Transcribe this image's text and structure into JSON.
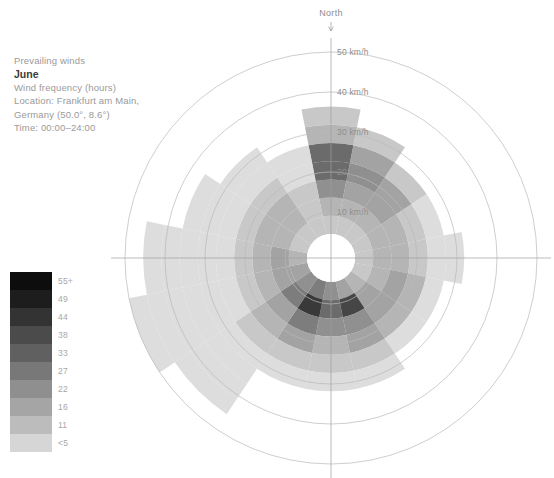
{
  "caption": {
    "title": "Prevailing winds",
    "month": "June",
    "metric": "Wind frequency (hours)",
    "location_line1": "Location: Frankfurt am Main,",
    "location_line2": "Germany (50.0°, 8.6°)",
    "time": "Time: 00:00–24:00"
  },
  "legend": {
    "name": "wind-frequency-hours",
    "labels": [
      "55+",
      "49",
      "44",
      "38",
      "33",
      "27",
      "22",
      "16",
      "11",
      "<5"
    ],
    "colors": [
      "#0d0d0d",
      "#1d1d1d",
      "#333333",
      "#4b4b4b",
      "#606060",
      "#787878",
      "#8f8f8f",
      "#a5a5a5",
      "#bcbcbc",
      "#d6d6d6"
    ]
  },
  "chart_data": {
    "type": "wind-rose",
    "title": "Prevailing winds",
    "subtitle": "June",
    "value_label": "Wind frequency (hours)",
    "orientation_label": "North",
    "center": {
      "x": 331,
      "y": 258
    },
    "radial_axis": {
      "label_suffix": "km/h",
      "ticks": [
        10,
        20,
        30,
        40,
        50
      ],
      "tick_labels": [
        "10 km/h",
        "20 km/h",
        "30 km/h",
        "40 km/h",
        "50 km/h"
      ],
      "tick_radii_px": [
        46,
        86,
        126,
        166,
        206
      ],
      "inner_hole_px": 24,
      "max": 50
    },
    "spokes": [
      0,
      90,
      180,
      270
    ],
    "sector_count": 16,
    "directions": [
      "N",
      "NNE",
      "NE",
      "ENE",
      "E",
      "ESE",
      "SE",
      "SSE",
      "S",
      "SSW",
      "SW",
      "WSW",
      "W",
      "WNW",
      "NW",
      "NNW"
    ],
    "speed_bins": [
      {
        "from": 0,
        "to": 5,
        "label": "<5"
      },
      {
        "from": 5,
        "to": 10,
        "label": "11"
      },
      {
        "from": 10,
        "to": 15,
        "label": "16"
      },
      {
        "from": 15,
        "to": 20,
        "label": "22"
      },
      {
        "from": 20,
        "to": 25,
        "label": "27"
      },
      {
        "from": 25,
        "to": 30,
        "label": "33"
      },
      {
        "from": 30,
        "to": 35,
        "label": "38"
      },
      {
        "from": 35,
        "to": 40,
        "label": "44"
      },
      {
        "from": 40,
        "to": 45,
        "label": "49"
      },
      {
        "from": 45,
        "to": 50,
        "label": "55+"
      }
    ],
    "note": "Each sector is a stack of radial bands. 'bands' lists, per direction, the grayscale index (0=darkest/55+ .. 9=lightest/<5) of each successive 5 km/h band outward from the hub; null ends the petal.",
    "sectors": [
      {
        "dir": "N",
        "angle": 0,
        "extent_kmh": 32,
        "bands": [
          8,
          7,
          5,
          3,
          3,
          7,
          8
        ]
      },
      {
        "dir": "NNE",
        "angle": 22.5,
        "extent_kmh": 30,
        "bands": [
          8,
          7,
          6,
          5,
          6,
          8
        ]
      },
      {
        "dir": "NE",
        "angle": 45,
        "extent_kmh": 25,
        "bands": [
          8,
          7,
          6,
          6,
          8
        ]
      },
      {
        "dir": "ENE",
        "angle": 67.5,
        "extent_kmh": 22,
        "bands": [
          8,
          7,
          7,
          8,
          9
        ]
      },
      {
        "dir": "E",
        "angle": 90,
        "extent_kmh": 26,
        "bands": [
          8,
          7,
          7,
          8,
          9,
          9
        ]
      },
      {
        "dir": "ESE",
        "angle": 112.5,
        "extent_kmh": 24,
        "bands": [
          8,
          7,
          6,
          7,
          9
        ]
      },
      {
        "dir": "SE",
        "angle": 135,
        "extent_kmh": 22,
        "bands": [
          7,
          6,
          6,
          7,
          9
        ]
      },
      {
        "dir": "SSE",
        "angle": 157.5,
        "extent_kmh": 30,
        "bands": [
          6,
          1,
          5,
          6,
          8,
          9
        ]
      },
      {
        "dir": "S",
        "angle": 180,
        "extent_kmh": 28,
        "bands": [
          5,
          3,
          5,
          7,
          8,
          9
        ]
      },
      {
        "dir": "SSW",
        "angle": 202.5,
        "extent_kmh": 30,
        "bands": [
          4,
          0,
          4,
          6,
          8,
          9
        ]
      },
      {
        "dir": "SW",
        "angle": 225,
        "extent_kmh": 45,
        "bands": [
          5,
          4,
          6,
          7,
          8,
          9,
          9,
          9,
          9
        ]
      },
      {
        "dir": "WSW",
        "angle": 247.5,
        "extent_kmh": 48,
        "bands": [
          6,
          6,
          7,
          8,
          9,
          9,
          9,
          9,
          9,
          9
        ]
      },
      {
        "dir": "W",
        "angle": 270,
        "extent_kmh": 42,
        "bands": [
          7,
          6,
          7,
          8,
          9,
          9,
          9,
          9,
          9
        ]
      },
      {
        "dir": "WNW",
        "angle": 292.5,
        "extent_kmh": 36,
        "bands": [
          8,
          7,
          7,
          8,
          9,
          9,
          9
        ]
      },
      {
        "dir": "NW",
        "angle": 315,
        "extent_kmh": 30,
        "bands": [
          8,
          7,
          7,
          8,
          9,
          9
        ]
      },
      {
        "dir": "NNW",
        "angle": 337.5,
        "extent_kmh": 22,
        "bands": [
          8,
          8,
          8,
          9,
          9
        ]
      }
    ]
  }
}
